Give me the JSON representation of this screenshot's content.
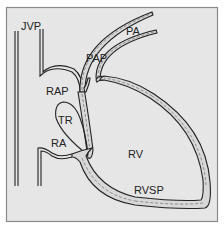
{
  "diagram": {
    "background": "#e6e6e6",
    "border_color": "#8a8a8a",
    "labels": {
      "jvp": "JVP",
      "pa": "PA",
      "pap": "PAP",
      "rap": "RAP",
      "tr": "TR",
      "ra": "RA",
      "rv": "RV",
      "rvsp": "RVSP"
    }
  }
}
